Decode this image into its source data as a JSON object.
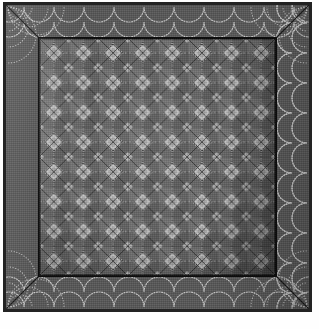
{
  "image": {
    "subject": "patchwork quilt",
    "description": "Dark geometric patchwork quilt photographed square-on, with a repeating diamond-and-star pieced center field, a plain medium-gray outer border covered in light dotted scallop quilting, mitered corners and a dark binding.",
    "background_color": "#fdfdfd",
    "width": 319,
    "height": 329
  },
  "quilt": {
    "binding": {
      "label": "binding",
      "color": "#232323",
      "thickness_px": 3
    },
    "border": {
      "label": "outer border",
      "fabric_color": "#585858",
      "width_px": 33,
      "quilting": {
        "motif": "scallop-arc",
        "stitch_color": "#d8d8d8",
        "stitch_style": "dotted",
        "arc_spacing_px": 25,
        "arc_radius_px": 15,
        "rows": 2
      },
      "corners": {
        "style": "mitered",
        "seam_color": "#141414",
        "count": 4
      }
    },
    "field": {
      "label": "center field",
      "background_color": "#1a1a1a",
      "block": {
        "name": "diamond-star block",
        "size_px": 29.6,
        "columns": 8,
        "rows": 8,
        "patch_colors": {
          "light": "#c9c9c9",
          "mid_light": "#9a9a9a",
          "mid": "#6e6e6e",
          "dark": "#2c2c2c",
          "darkest": "#0c0c0c"
        },
        "stitch_color": "#e8e8e8"
      }
    }
  },
  "palette": {
    "white": "#ffffff",
    "light_gray": "#c9c9c9",
    "mid_gray": "#6e6e6e",
    "border_gray": "#585858",
    "dark_gray": "#2c2c2c",
    "near_black": "#0c0c0c",
    "stitch": "#e2e2e2"
  }
}
